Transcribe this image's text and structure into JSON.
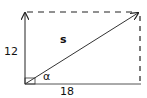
{
  "diagram": {
    "type": "vector-triangle",
    "labels": {
      "vertical_side": "12",
      "horizontal_side": "18",
      "hypotenuse": "s",
      "angle": "α"
    },
    "colors": {
      "stroke": "#222222",
      "background": "#ffffff"
    }
  }
}
